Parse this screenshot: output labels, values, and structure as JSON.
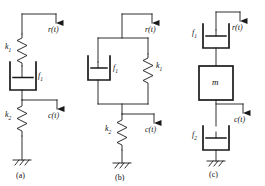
{
  "figure": {
    "type": "mechanical-network-diagram",
    "panel_count": 3,
    "stroke_color": "#1a1a1a",
    "background": "#ffffff"
  },
  "panels": [
    {
      "id": "a",
      "caption": "(a)",
      "description": "spring k1 in series with damper f1, then spring k2 to ground",
      "input_label": "r(t)",
      "output_label": "c(t)",
      "elements": [
        {
          "name": "spring",
          "label": "k",
          "sub": "1"
        },
        {
          "name": "damper",
          "label": "f",
          "sub": "1"
        },
        {
          "name": "spring",
          "label": "k",
          "sub": "2"
        },
        {
          "name": "ground",
          "label": ""
        }
      ]
    },
    {
      "id": "b",
      "caption": "(b)",
      "description": "damper f1 parallel with spring k1, in series with spring k2 to ground",
      "input_label": "r(t)",
      "output_label": "c(t)",
      "elements": [
        {
          "name": "damper",
          "label": "f",
          "sub": "1"
        },
        {
          "name": "spring",
          "label": "k",
          "sub": "1"
        },
        {
          "name": "spring",
          "label": "k",
          "sub": "2"
        },
        {
          "name": "ground",
          "label": ""
        }
      ]
    },
    {
      "id": "c",
      "caption": "(c)",
      "description": "damper f1 in series with mass m, in series with damper f2 to ground",
      "input_label": "r(t)",
      "output_label": "c(t)",
      "elements": [
        {
          "name": "damper",
          "label": "f",
          "sub": "1"
        },
        {
          "name": "mass",
          "label": "m",
          "sub": ""
        },
        {
          "name": "damper",
          "label": "f",
          "sub": "2"
        },
        {
          "name": "ground",
          "label": ""
        }
      ]
    }
  ],
  "labels": {
    "a_k1": "k",
    "a_k1_sub": "1",
    "a_f1": "f",
    "a_f1_sub": "1",
    "a_k2": "k",
    "a_k2_sub": "2",
    "a_rt": "r(t)",
    "a_ct": "c(t)",
    "a_cap": "(a)",
    "b_f1": "f",
    "b_f1_sub": "1",
    "b_k1": "k",
    "b_k1_sub": "1",
    "b_k2": "k",
    "b_k2_sub": "2",
    "b_rt": "r(t)",
    "b_ct": "c(t)",
    "b_cap": "(b)",
    "c_f1": "f",
    "c_f1_sub": "1",
    "c_m": "m",
    "c_f2": "f",
    "c_f2_sub": "2",
    "c_rt": "r(t)",
    "c_ct": "c(t)",
    "c_cap": "(c)"
  }
}
